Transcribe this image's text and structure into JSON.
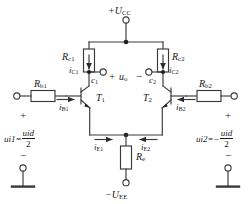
{
  "diagram": {
    "colors": {
      "wire": "#3a3a3a",
      "text": "#1a1a1a",
      "background": "#ffffff"
    }
  },
  "supplies": {
    "positive": "+U",
    "positive_sub": "CC",
    "negative": "−U",
    "negative_sub": "EE"
  },
  "components": {
    "rc1": {
      "label": "R",
      "sub": "c1"
    },
    "rc2": {
      "label": "R",
      "sub": "c2"
    },
    "rb1": {
      "label": "R",
      "sub": "b1"
    },
    "rb2": {
      "label": "R",
      "sub": "b2"
    },
    "re": {
      "label": "R",
      "sub": "e"
    },
    "t1": {
      "label": "T",
      "sub": "1"
    },
    "t2": {
      "label": "T",
      "sub": "2"
    }
  },
  "currents": {
    "ic1": {
      "label": "i",
      "sub": "C1"
    },
    "ic2": {
      "label": "i",
      "sub": "C2"
    },
    "ib1": {
      "label": "i",
      "sub": "B1"
    },
    "ib2": {
      "label": "i",
      "sub": "B2"
    },
    "ie1": {
      "label": "i",
      "sub": "E1"
    },
    "ie2": {
      "label": "i",
      "sub": "E2"
    }
  },
  "nodes": {
    "c1": {
      "label": "c",
      "sub": "1"
    },
    "c2": {
      "label": "c",
      "sub": "2"
    }
  },
  "voltages": {
    "output": {
      "label": "u",
      "sub": "o"
    },
    "out_plus": "+",
    "out_minus": "−",
    "input_left": {
      "name": "u",
      "sub": "i1",
      "equals": "=",
      "numer": "u",
      "numer_sub": "id",
      "denom": "2",
      "plus": "+",
      "minus": "−"
    },
    "input_right": {
      "name": "u",
      "sub": "i2",
      "equals": "=−",
      "numer": "u",
      "numer_sub": "id",
      "denom": "2",
      "plus": "+",
      "minus": "−"
    }
  },
  "terminals": {
    "supply_top": "supply-terminal",
    "supply_bottom": "supply-terminal",
    "out_left": "output-terminal",
    "out_right": "output-terminal",
    "in_left": "input-terminal",
    "in_right": "input-terminal",
    "gnd_left": "ground-terminal",
    "gnd_right": "ground-terminal"
  }
}
